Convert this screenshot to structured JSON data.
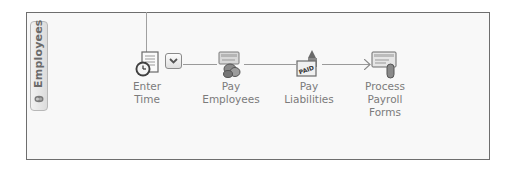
{
  "panel": {
    "tab_label": "Employees",
    "tab_icon": "people-icon"
  },
  "workflow": {
    "nodes": [
      {
        "id": "enter-time",
        "label_line1": "Enter",
        "label_line2": "Time",
        "label_line3": "",
        "icon": "timesheet-clock-icon",
        "has_dropdown": true
      },
      {
        "id": "pay-employees",
        "label_line1": "Pay",
        "label_line2": "Employees",
        "label_line3": "",
        "icon": "paycheck-coins-icon"
      },
      {
        "id": "pay-liabilities",
        "label_line1": "Pay",
        "label_line2": "Liabilities",
        "label_line3": "",
        "icon": "paid-stamp-icon"
      },
      {
        "id": "process-payroll-forms",
        "label_line1": "Process",
        "label_line2": "Payroll",
        "label_line3": "Forms",
        "icon": "payroll-form-icon"
      }
    ],
    "dropdown_icon": "chevron-down-icon"
  },
  "colors": {
    "border": "#6e6e6e",
    "panel_bg": "#f8f8f8",
    "label_text": "#7b7b7b",
    "connector": "#9a9a9a"
  }
}
